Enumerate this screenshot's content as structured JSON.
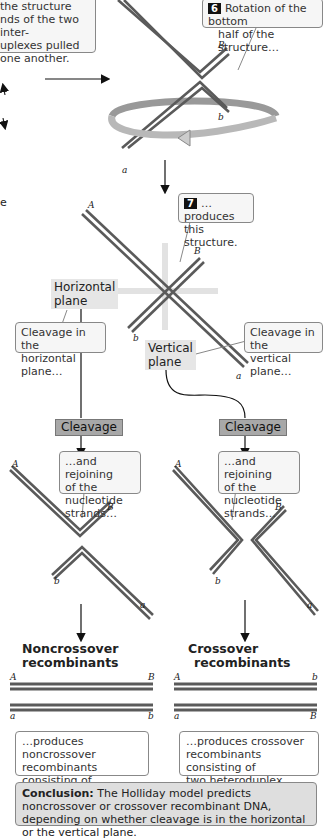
{
  "top_left_callout": {
    "lines": [
      "the structure",
      "nds of the two inter-",
      "uplexes pulled",
      "one another."
    ]
  },
  "step6": {
    "number": "6",
    "text_line1": "Rotation of the bottom",
    "text_line2": "half of the structure…"
  },
  "step7": {
    "number": "7",
    "text_line1": "…produces",
    "text_line2": "this structure."
  },
  "left_edge_text": "e",
  "labels": {
    "rotated": {
      "A": "",
      "B": "B",
      "b": "b",
      "a": "a"
    },
    "structure": {
      "A": "A",
      "B": "B",
      "b": "b",
      "a": "a"
    },
    "noncross_panel": {
      "A": "A",
      "B": "B",
      "b": "b",
      "a": "a"
    },
    "cross_panel": {
      "A": "A",
      "B": "B",
      "b": "b",
      "a": "a"
    },
    "noncross_result": {
      "A": "A",
      "B": "B",
      "a": "a",
      "b": "b"
    },
    "cross_result": {
      "A": "A",
      "b": "b",
      "a": "a",
      "B": "B"
    }
  },
  "planes": {
    "horizontal_line1": "Horizontal",
    "horizontal_line2": "plane",
    "vertical_line1": "Vertical",
    "vertical_line2": "plane"
  },
  "cleavage_callouts": {
    "horizontal_line1": "Cleavage in the",
    "horizontal_line2": "horizontal plane…",
    "vertical_line1": "Cleavage in the",
    "vertical_line2": "vertical plane…"
  },
  "cleavage_buttons": {
    "left": "Cleavage",
    "right": "Cleavage"
  },
  "rejoin_callout": {
    "line1": "…and rejoining",
    "line2": "of the nucleotide",
    "line3": "strands…"
  },
  "headings": {
    "noncross_line1": "Noncrossover",
    "noncross_line2": "recombinants",
    "cross_line1": "Crossover",
    "cross_line2": "recombinants"
  },
  "results": {
    "noncross_line1": "…produces noncrossover",
    "noncross_line2": "recombinants consisting of",
    "noncross_line3": "two heteroduplex molecules.",
    "cross_line1": "…produces crossover",
    "cross_line2": "recombinants consisting of",
    "cross_line3": "two heteroduplex molecules."
  },
  "conclusion": {
    "label": "Conclusion:",
    "text": " The Holliday model predicts noncrossover or crossover recombinant DNA, depending on whether cleavage is in the horizontal or the vertical plane."
  },
  "colors": {
    "strand": "#5a5a5a",
    "panel": "#ececec",
    "callout_border": "#888888",
    "cleavage_box": "#a8a8a8"
  }
}
